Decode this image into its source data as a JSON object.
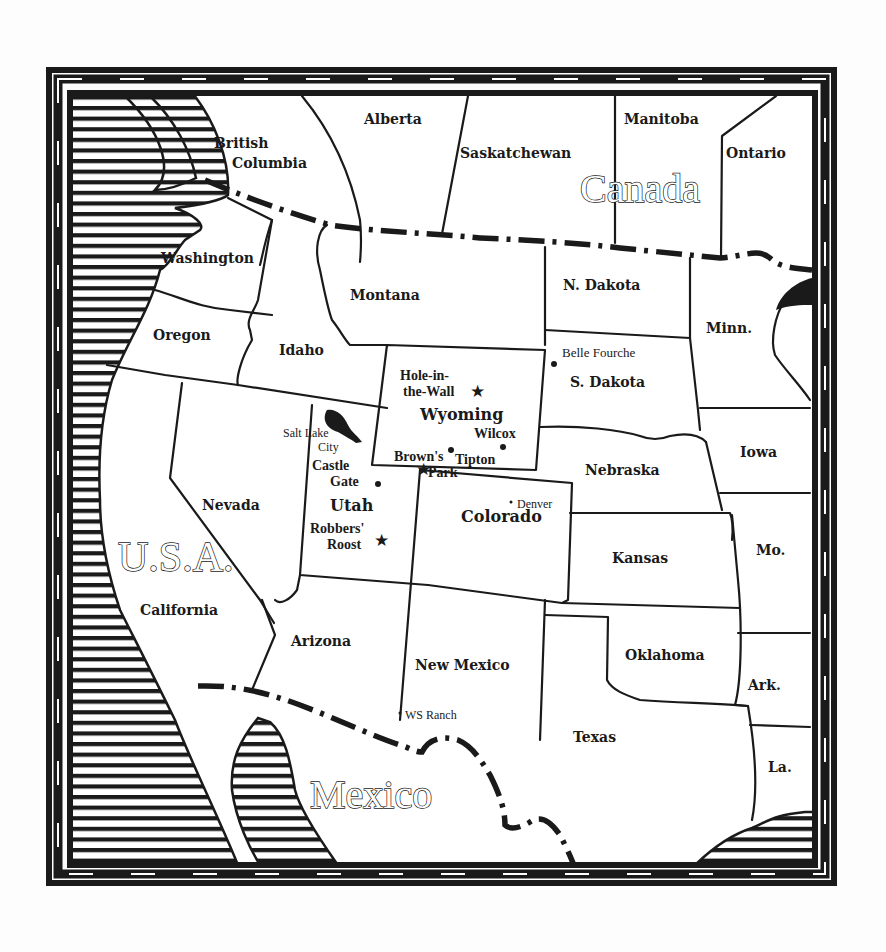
{
  "map": {
    "countries": [
      {
        "id": "canada",
        "label": "Canada"
      },
      {
        "id": "usa",
        "label": "U.S.A."
      },
      {
        "id": "mexico",
        "label": "Mexico"
      }
    ],
    "provinces": [
      {
        "id": "british-columbia",
        "lines": [
          "British",
          "Columbia"
        ]
      },
      {
        "id": "alberta",
        "label": "Alberta"
      },
      {
        "id": "saskatchewan",
        "label": "Saskatchewan"
      },
      {
        "id": "manitoba",
        "label": "Manitoba"
      },
      {
        "id": "ontario",
        "label": "Ontario"
      }
    ],
    "states": [
      {
        "id": "washington",
        "label": "Washington"
      },
      {
        "id": "oregon",
        "label": "Oregon"
      },
      {
        "id": "idaho",
        "label": "Idaho"
      },
      {
        "id": "montana",
        "label": "Montana"
      },
      {
        "id": "wyoming",
        "label": "Wyoming"
      },
      {
        "id": "nevada",
        "label": "Nevada"
      },
      {
        "id": "utah",
        "label": "Utah"
      },
      {
        "id": "colorado",
        "label": "Colorado"
      },
      {
        "id": "california",
        "label": "California"
      },
      {
        "id": "arizona",
        "label": "Arizona"
      },
      {
        "id": "new-mexico",
        "label": "New Mexico"
      },
      {
        "id": "n-dakota",
        "label": "N. Dakota"
      },
      {
        "id": "s-dakota",
        "label": "S. Dakota"
      },
      {
        "id": "nebraska",
        "label": "Nebraska"
      },
      {
        "id": "kansas",
        "label": "Kansas"
      },
      {
        "id": "oklahoma",
        "label": "Oklahoma"
      },
      {
        "id": "texas",
        "label": "Texas"
      },
      {
        "id": "minn",
        "label": "Minn."
      },
      {
        "id": "iowa",
        "label": "Iowa"
      },
      {
        "id": "mo",
        "label": "Mo."
      },
      {
        "id": "ark",
        "label": "Ark."
      },
      {
        "id": "la",
        "label": "La."
      }
    ],
    "places": [
      {
        "id": "hole-in-the-wall",
        "lines": [
          "Hole-in-",
          "the-Wall"
        ],
        "marker": "star"
      },
      {
        "id": "browns-park",
        "lines": [
          "Brown's",
          "Park"
        ],
        "marker": "star"
      },
      {
        "id": "robbers-roost",
        "lines": [
          "Robbers'",
          "Roost"
        ],
        "marker": "star"
      },
      {
        "id": "castle-gate",
        "lines": [
          "Castle",
          "Gate"
        ],
        "marker": "dot"
      },
      {
        "id": "belle-fourche",
        "label": "Belle Fourche",
        "marker": "dot"
      },
      {
        "id": "wilcox",
        "label": "Wilcox",
        "marker": "dot"
      },
      {
        "id": "tipton",
        "label": "Tipton",
        "marker": "dot"
      },
      {
        "id": "salt-lake-city",
        "lines": [
          "Salt Lake",
          "City"
        ],
        "marker": "none"
      },
      {
        "id": "denver",
        "label": "Denver",
        "marker": "small-dot"
      },
      {
        "id": "ws-ranch",
        "label": "WS Ranch",
        "marker": "small-dot"
      }
    ]
  }
}
